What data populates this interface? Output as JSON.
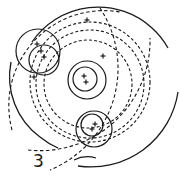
{
  "figure": {
    "label": "3",
    "stroke_color": "#1a1a1a",
    "background": "#ffffff",
    "solid_arcs": [
      {
        "name": "outer-top-arc",
        "d": "M 32 42 A 80 80 0 0 1 152 28 L 152 28 A 80 80 0 0 1 168 48"
      },
      {
        "name": "outer-bottom-arc",
        "d": "M 178 92 A 88 88 0 0 1 78 166"
      },
      {
        "name": "outer-left-arc",
        "d": "M 11 62 A 75 75 0 0 0 40 137 L 40 137 A 75 75 0 0 0 58 148"
      },
      {
        "name": "bottom-short-arc",
        "d": "M 74 160 A 30 30 0 0 1 96 158"
      }
    ],
    "dashed_circles": [
      {
        "name": "dashed-orbit-inner",
        "cx": 88,
        "cy": 84,
        "r": 44
      },
      {
        "name": "dashed-orbit-middle",
        "cx": 90,
        "cy": 84,
        "r": 54
      },
      {
        "name": "dashed-orbit-outer",
        "cx": 90,
        "cy": 82,
        "r": 60
      }
    ],
    "dashed_arcs": [
      {
        "name": "dashed-arc-a",
        "d": "M 12 130 A 95 95 0 0 1 120 12"
      },
      {
        "name": "dashed-arc-b",
        "d": "M 28 150 A 110 110 0 0 0 150 38"
      },
      {
        "name": "dashed-arc-c",
        "d": "M 100 8 A 110 110 0 0 1 50 170"
      }
    ],
    "solid_circles": [
      {
        "name": "upper-left-large-circle",
        "cx": 38,
        "cy": 51,
        "r": 22
      },
      {
        "name": "upper-left-small-circle",
        "cx": 44,
        "cy": 60,
        "r": 15
      },
      {
        "name": "center-large-circle",
        "cx": 87,
        "cy": 80,
        "r": 19
      },
      {
        "name": "center-small-circle",
        "cx": 85,
        "cy": 79,
        "r": 12
      },
      {
        "name": "lower-large-circle",
        "cx": 94,
        "cy": 129,
        "r": 18
      },
      {
        "name": "lower-small-circle",
        "cx": 92,
        "cy": 125,
        "r": 11
      }
    ],
    "cross_marks": [
      {
        "x": 87,
        "y": 20
      },
      {
        "x": 37,
        "y": 44
      },
      {
        "x": 41,
        "y": 51
      },
      {
        "x": 44,
        "y": 57
      },
      {
        "x": 34,
        "y": 77
      },
      {
        "x": 84,
        "y": 76
      },
      {
        "x": 86,
        "y": 82
      },
      {
        "x": 103,
        "y": 56
      },
      {
        "x": 92,
        "y": 129
      },
      {
        "x": 95,
        "y": 124
      }
    ]
  }
}
